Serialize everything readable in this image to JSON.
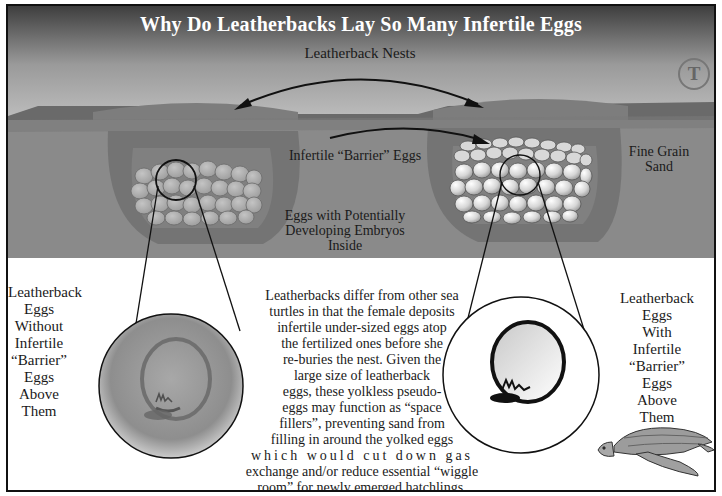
{
  "top_caption": "",
  "title": "Why Do Leatherbacks Lay So Many Infertile Eggs",
  "trademark": {
    "letter": "T",
    "icon": "trademark-circle-icon"
  },
  "scene_labels": {
    "nests": "Leatherback Nests",
    "barrier_eggs": "Infertile “Barrier” Eggs",
    "embryos_line1": "Eggs with Potentially",
    "embryos_line2": "Developing Embryos",
    "embryos_line3": "Inside",
    "sand_line1": "Fine Grain",
    "sand_line2": "Sand"
  },
  "left_panel": {
    "lines": [
      "Leatherback",
      "Eggs",
      "Without",
      "Infertile",
      "“Barrier”",
      "Eggs",
      "Above",
      "Them"
    ]
  },
  "right_panel": {
    "lines": [
      "Leatherback",
      "Eggs",
      "With",
      "Infertile",
      "“Barrier”",
      "Eggs",
      "Above",
      "Them"
    ]
  },
  "explanation": {
    "lines": [
      "Leatherbacks differ from other sea",
      "turtles in that the female deposits",
      "infertile under-sized eggs atop",
      "the fertilized ones before she",
      "re-buries the nest.  Given the",
      "large size of leatherback",
      "eggs, these yolkless pseudo-",
      "eggs may function as “space",
      "fillers”, preventing sand from",
      "filling in around the yolked eggs",
      "which would cut down gas",
      "exchange and/or reduce essential “wiggle",
      "room” for newly emerged hatchlings."
    ]
  },
  "colors": {
    "sky_top": "#4a4a4a",
    "sky_bottom": "#c4c4c4",
    "sand": "#8a8a8a",
    "sand_dark": "#6e6e6e",
    "nest_cavity": "#7c7c7c",
    "egg_light": "#bdbdbd",
    "egg_white": "#f0f0f0",
    "frame": "#111111"
  },
  "icons": {
    "left_zoom": "egg-without-barrier-magnified-icon",
    "right_zoom": "egg-with-barrier-magnified-icon",
    "turtle": "leatherback-turtle-icon"
  }
}
